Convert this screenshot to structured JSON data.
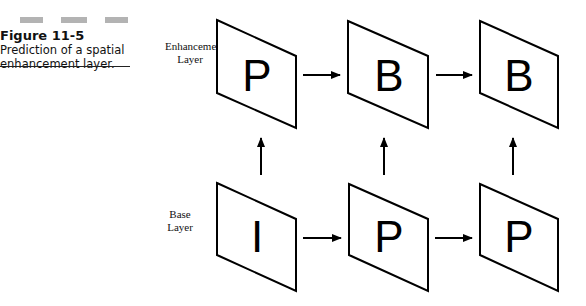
{
  "figure": {
    "title": "Figure 11-5",
    "caption_line1": "Prediction of a spatial",
    "caption_line2": "enhancement layer."
  },
  "layers": {
    "enhancement": {
      "line1": "Enhancement",
      "line2": "Layer",
      "frames": [
        "P",
        "B",
        "B"
      ]
    },
    "base": {
      "line1": "Base",
      "line2": "Layer",
      "frames": [
        "I",
        "P",
        "P"
      ]
    }
  },
  "colors": {
    "stroke": "#000000",
    "bar": "#b3b3b3"
  }
}
